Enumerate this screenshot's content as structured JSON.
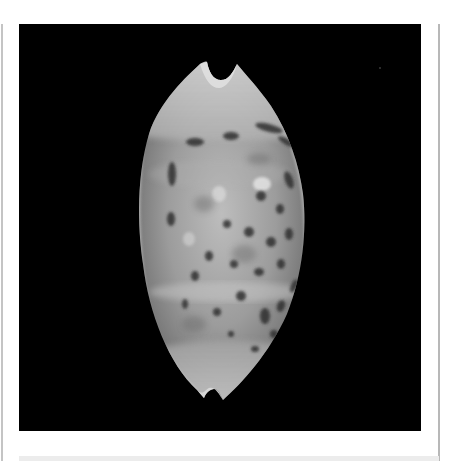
{
  "image": {
    "subject": "cowrie-shell",
    "description": "Grayscale photograph of a spotted cowrie shell (dorsal view) on a black background",
    "background_color": "#000000",
    "frame_color": "#ffffff",
    "frame_line_color": "#c0c0c0"
  }
}
